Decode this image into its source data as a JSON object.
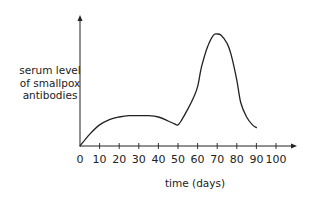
{
  "chart_data": {
    "type": "line",
    "title": "",
    "xlabel": "time (days)",
    "ylabel": "serum level of smallpox antibodies",
    "ylabel_lines": [
      "serum level",
      "of smallpox",
      "antibodies"
    ],
    "x_ticks": [
      0,
      10,
      20,
      30,
      40,
      50,
      60,
      70,
      80,
      90,
      100
    ],
    "xlim": [
      0,
      100
    ],
    "ylim": [
      0,
      100
    ],
    "y_ticks": [],
    "grid": false,
    "legend": null,
    "series": [
      {
        "name": "serum level of smallpox antibodies",
        "x": [
          0,
          5,
          10,
          15,
          20,
          25,
          30,
          35,
          40,
          45,
          48,
          50,
          52,
          55,
          58,
          60,
          62,
          65,
          68,
          70,
          72,
          75,
          77,
          80,
          82,
          85,
          88,
          90
        ],
        "y": [
          0,
          9,
          16,
          20,
          22,
          23,
          23,
          23,
          22,
          19,
          17,
          16,
          20,
          28,
          37,
          45,
          60,
          75,
          84,
          85,
          84,
          78,
          70,
          50,
          33,
          22,
          16,
          14
        ]
      }
    ],
    "annotations": []
  },
  "axes": {
    "x_label": "time (days)",
    "y_label_lines": [
      "serum level",
      "of smallpox",
      "antibodies"
    ]
  }
}
